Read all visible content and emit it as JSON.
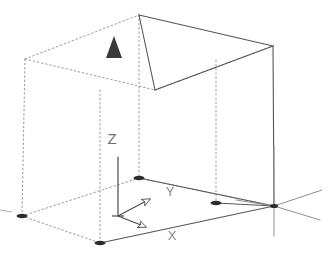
{
  "diagram": {
    "type": "isometric-wireframe",
    "background_color": "#ffffff",
    "solid_line_color": "#555555",
    "hidden_line_color": "#9a9a9a",
    "vertex_marker_color": "#2b2b2b",
    "label_color": "#6e6e6e",
    "north_arrow_color": "#3a3a3a"
  },
  "axes": {
    "z": {
      "label": "Z",
      "label_x": 112,
      "label_y": 144,
      "direction": "up"
    },
    "y": {
      "label": "Y",
      "label_x": 170,
      "label_y": 196,
      "direction": "right-back"
    },
    "x": {
      "label": "X",
      "label_x": 172,
      "label_y": 240,
      "direction": "right-front"
    }
  },
  "markers": {
    "north_arrow": {
      "name": "north-arrow",
      "x": 114,
      "y": 45
    },
    "vertices": [
      {
        "name": "vertex-base-left",
        "x": 22,
        "y": 216
      },
      {
        "name": "vertex-base-front",
        "x": 100,
        "y": 243
      },
      {
        "name": "vertex-base-back",
        "x": 139,
        "y": 178
      },
      {
        "name": "vertex-base-right",
        "x": 216,
        "y": 203
      },
      {
        "name": "vertex-origin",
        "x": 274,
        "y": 206
      }
    ]
  },
  "box": {
    "top_face": {
      "back": {
        "x": 25,
        "y": 59
      },
      "apex": {
        "x": 139,
        "y": 15
      },
      "right": {
        "x": 273,
        "y": 46
      },
      "front": {
        "x": 155,
        "y": 90
      }
    },
    "bottom_face": {
      "left": {
        "x": 22,
        "y": 216
      },
      "back": {
        "x": 139,
        "y": 178
      },
      "right": {
        "x": 274,
        "y": 206
      },
      "front": {
        "x": 100,
        "y": 243
      }
    }
  },
  "origin_crosshair": {
    "name": "origin-crosshair",
    "x": 274,
    "y": 206,
    "vertical_top": 146,
    "vertical_bottom": 236,
    "ray_right_up": {
      "x": 322,
      "y": 190
    },
    "ray_right_down": {
      "x": 320,
      "y": 220
    }
  }
}
